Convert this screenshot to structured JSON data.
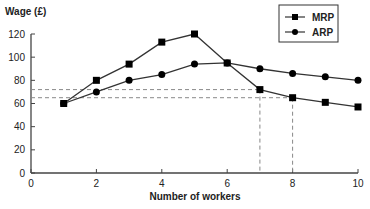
{
  "chart_data": {
    "type": "line",
    "title": "",
    "ylabel": "Wage (£)",
    "xlabel": "Number of workers",
    "xlim": [
      0,
      10
    ],
    "ylim": [
      0,
      120
    ],
    "x_ticks": [
      0,
      2,
      4,
      6,
      8,
      10
    ],
    "y_ticks": [
      0,
      20,
      40,
      60,
      80,
      100,
      120
    ],
    "grid": false,
    "legend_position": "top-right",
    "x": [
      1,
      2,
      3,
      4,
      5,
      6,
      7,
      8,
      9,
      10
    ],
    "series": [
      {
        "name": "MRP",
        "marker": "square",
        "values": [
          60,
          80,
          94,
          113,
          120,
          95,
          72,
          65,
          61,
          57
        ]
      },
      {
        "name": "ARP",
        "marker": "circle",
        "values": [
          60,
          70,
          80,
          85,
          94,
          95,
          90,
          86,
          83,
          80
        ]
      }
    ],
    "annotations": [
      {
        "type": "dashed-guide",
        "x": 7,
        "y": 72
      },
      {
        "type": "dashed-guide",
        "x": 8,
        "y": 65
      }
    ]
  },
  "labels": {
    "ylabel": "Wage (£)",
    "xlabel": "Number of workers",
    "legend_mrp": "MRP",
    "legend_arp": "ARP"
  },
  "colors": {
    "line": "#333333",
    "marker": "#000000",
    "dash": "#888888"
  }
}
